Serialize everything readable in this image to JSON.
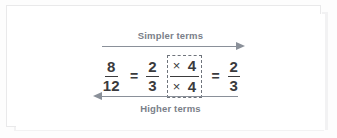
{
  "figure": {
    "name": "simplifying-and-raising-fractions-diagram",
    "colors": {
      "arrow": "#8a9099",
      "label_text": "#7a8089",
      "equation_text": "#3b3b3d",
      "dashed_box": "#6f747c",
      "card_background": "#ffffff",
      "frame_border": "#e9e9ea"
    }
  },
  "top_arrow": {
    "label": "Simpler terms",
    "direction": "right",
    "icon": "arrow-right-icon"
  },
  "bottom_arrow": {
    "label": "Higher terms",
    "direction": "left",
    "icon": "arrow-left-icon"
  },
  "equation": {
    "left_fraction": {
      "numerator": "8",
      "denominator": "12"
    },
    "equals_1": "=",
    "middle_fraction": {
      "numerator": "2",
      "denominator": "3"
    },
    "multiplier_box": {
      "numerator_operator": "×",
      "numerator_value": "4",
      "denominator_operator": "×",
      "denominator_value": "4"
    },
    "equals_2": "=",
    "right_fraction": {
      "numerator": "2",
      "denominator": "3"
    }
  },
  "chart_data": {
    "type": "table",
    "annotations": [
      "Simpler terms",
      "Higher terms"
    ],
    "categories": [
      "8/12",
      "2/3 × (4/4)",
      "2/3"
    ],
    "values": [
      0.6667,
      0.6667,
      0.6667
    ]
  }
}
